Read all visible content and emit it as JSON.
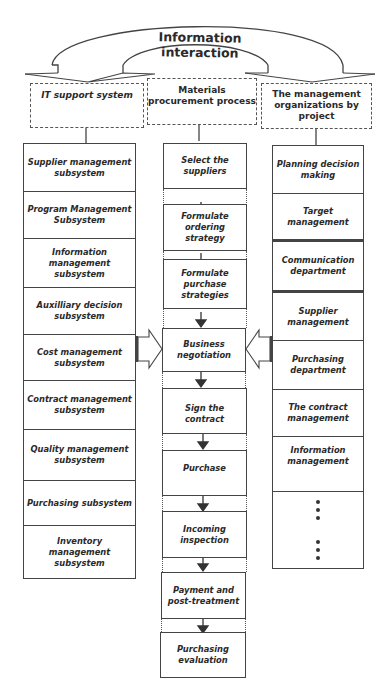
{
  "diagram": {
    "arc_label": "Information interaction",
    "headers": {
      "left": "IT support system",
      "center": "Materials procurement process",
      "right": "The management organizations by project"
    },
    "left_column": [
      "Supplier management subsystem",
      "Program Management Subsystem",
      "Information management subsystem",
      "Auxilliary decision subsystem",
      "Cost management subsystem",
      "Contract management subsystem",
      "Quality management subsystem",
      "Purchasing subsystem",
      "Inventory management subsystem"
    ],
    "center_column": [
      "Select the suppliers",
      "Formulate ordering strategy",
      "Formulate purchase strategies",
      "Business negotiation",
      "Sign the contract",
      "Purchase",
      "Incoming inspection",
      "Payment and post-treatment",
      "Purchasing evaluation"
    ],
    "right_column": [
      "Planning decision making",
      "Target management",
      "Communication department",
      "Supplier management",
      "Purchasing department",
      "The contract management",
      "Information management"
    ],
    "right_column_ellipsis": "⋮ ⋮"
  }
}
